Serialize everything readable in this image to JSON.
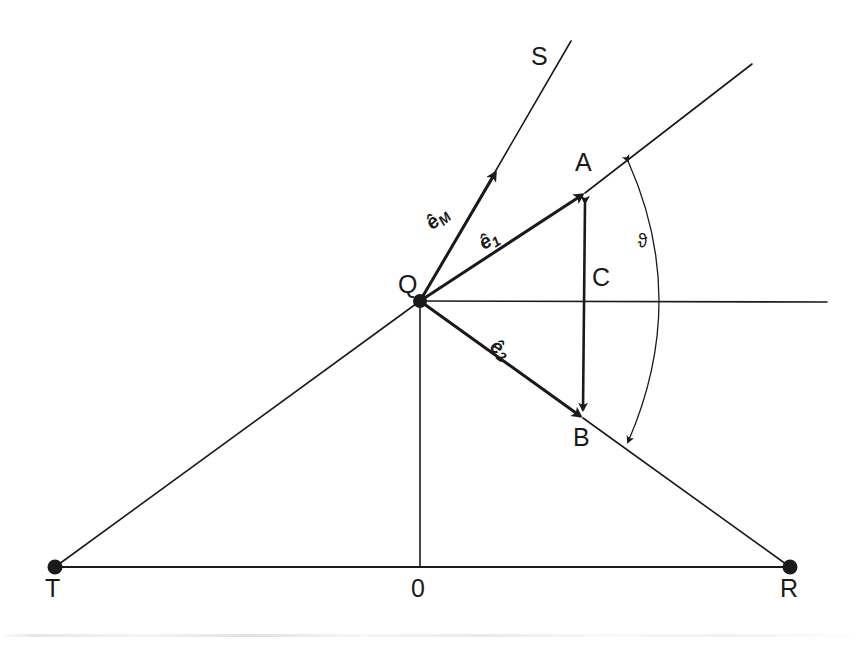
{
  "figure": {
    "background_color": "#ffffff",
    "stroke_color": "#1a1a1a",
    "width": 862,
    "height": 647
  },
  "points": {
    "Q": {
      "label": "Q",
      "x": 420,
      "y": 301,
      "has_dot": true,
      "label_x": 398,
      "label_y": 272
    },
    "A": {
      "label": "A",
      "x": 585,
      "y": 193,
      "has_dot": false,
      "label_x": 575,
      "label_y": 150
    },
    "B": {
      "label": "B",
      "x": 583,
      "y": 418,
      "has_dot": false,
      "label_x": 573,
      "label_y": 425
    },
    "C": {
      "label": "C",
      "x": 585,
      "y": 301,
      "has_dot": false,
      "label_x": 592,
      "label_y": 265
    },
    "T": {
      "label": "T",
      "x": 55,
      "y": 567,
      "has_dot": true,
      "label_x": 45,
      "label_y": 576
    },
    "R": {
      "label": "R",
      "x": 790,
      "y": 567,
      "has_dot": true,
      "label_x": 780,
      "label_y": 576
    },
    "O": {
      "label": "0",
      "x": 420,
      "y": 567,
      "has_dot": false,
      "label_x": 411,
      "label_y": 576
    },
    "S": {
      "label": "S",
      "x": 571,
      "y": 38,
      "has_dot": false,
      "label_x": 531,
      "label_y": 44
    }
  },
  "vectors": [
    {
      "name": "e_M",
      "label_base": "ê",
      "label_sub": "M",
      "from": "Q",
      "to_x": 497,
      "to_y": 170,
      "label_x": 429,
      "label_y": 215,
      "label_rotation": -42,
      "arrowhead": true
    },
    {
      "name": "e_1",
      "label_base": "ê",
      "label_sub": "1",
      "from": "Q",
      "to_x": 585,
      "to_y": 193,
      "label_x": 481,
      "label_y": 234,
      "label_rotation": -32,
      "arrowhead": true
    },
    {
      "name": "e_2",
      "label_base": "ê",
      "label_sub": "2",
      "from": "Q",
      "to_x": 583,
      "to_y": 418,
      "label_x": 492,
      "label_y": 333,
      "label_rotation": 35,
      "arrowhead": true
    }
  ],
  "segments": [
    {
      "name": "ray-S-extension",
      "x1": 420,
      "y1": 301,
      "x2": 571,
      "y2": 41,
      "width": 1.6
    },
    {
      "name": "ray-QA-extension",
      "x1": 585,
      "y1": 193,
      "x2": 752,
      "y2": 64,
      "width": 1.6
    },
    {
      "name": "ray-QB-extension",
      "x1": 583,
      "y1": 418,
      "x2": 790,
      "y2": 567,
      "width": 1.6
    },
    {
      "name": "horizontal-axis-QC",
      "x1": 420,
      "y1": 301,
      "x2": 827,
      "y2": 302,
      "width": 1.6
    },
    {
      "name": "line-QT",
      "x1": 420,
      "y1": 301,
      "x2": 55,
      "y2": 567,
      "width": 1.6
    },
    {
      "name": "baseline-TR",
      "x1": 55,
      "y1": 567,
      "x2": 790,
      "y2": 567,
      "width": 2.0
    },
    {
      "name": "vertical-Q-to-origin",
      "x1": 420,
      "y1": 301,
      "x2": 420,
      "y2": 567,
      "width": 1.6
    }
  ],
  "double_arrow_segment": {
    "name": "segment-BA",
    "x1": 585,
    "y1": 203,
    "x2": 583,
    "y2": 410,
    "width": 2.6
  },
  "angle_arc": {
    "name": "angle-theta",
    "label": "ϑ",
    "label_x": 637,
    "label_y": 231,
    "start_x": 628,
    "start_y": 161,
    "control_x": 690,
    "control_y": 300,
    "end_x": 628,
    "end_y": 442,
    "width": 1.3
  },
  "scan_artifact": {
    "y": 634,
    "visible": true
  }
}
